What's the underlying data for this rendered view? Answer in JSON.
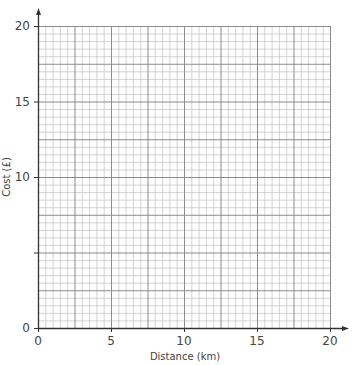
{
  "chart_data": {
    "type": "line",
    "title": "",
    "xlabel": "Distance (km)",
    "ylabel": "Cost (£)",
    "xlim": [
      0,
      20
    ],
    "ylim": [
      0,
      20
    ],
    "x_ticks": [
      0,
      5,
      10,
      15,
      20
    ],
    "x_tick_labels": [
      "0",
      "5",
      "10",
      "15",
      "20"
    ],
    "y_ticks": [
      0,
      5,
      10,
      15,
      20
    ],
    "y_tick_labels": [
      "0",
      "",
      "10",
      "15",
      "20"
    ],
    "grid": true,
    "grid_minor_step": 0.5,
    "grid_major_step": 2.5,
    "series": [],
    "legend": null,
    "note": "Blank graph paper grid; no data plotted"
  },
  "axes": {
    "x_title": "Distance (km)",
    "y_title": "Cost (£)",
    "x_labels": [
      "0",
      "5",
      "10",
      "15",
      "20"
    ],
    "y_labels": [
      "0",
      "10",
      "15",
      "20"
    ]
  },
  "colors": {
    "minor_grid": "#c8c8c8",
    "major_grid": "#8c8c8c",
    "axis": "#333333"
  }
}
